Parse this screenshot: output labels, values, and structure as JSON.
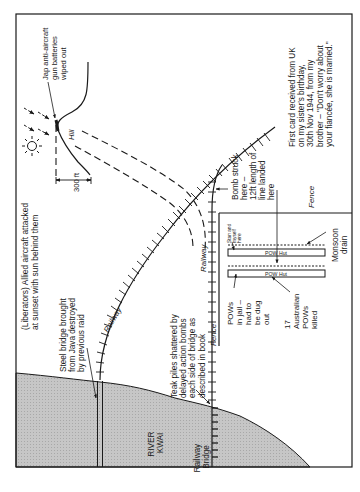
{
  "diagram": {
    "colors": {
      "ink": "#1a1a1a",
      "river_fill": "#c8c8c8",
      "paper": "#ffffff"
    },
    "labels": {
      "liberators": [
        "(Liberators) Allied aircraft attacked",
        "at sunset with sun behind them"
      ],
      "jap_guns": [
        "Jap anti-aircraft",
        "gun batteries",
        "wiped out"
      ],
      "hill": "Hill",
      "height": "300 ft",
      "first_card": [
        "First card received from UK",
        "on my sister's birthday,",
        "30th Nov 1944, from my",
        "brother – \"Don't worry about",
        "your fiancée, she is married.\""
      ],
      "steel_bridge": [
        "Steel bridge brought",
        "from Java destroyed",
        "by previous raid"
      ],
      "railway_curve": "Railway",
      "railway_straight": "Railway",
      "bomb_struck": [
        "Bomb struck",
        "here –",
        "12ft length of",
        "line landed",
        "here"
      ],
      "fence_top": "Fence",
      "fence_side": "Fence",
      "stan": [
        "Stan and",
        "myself",
        "here"
      ],
      "monsoon_drain": [
        "Monsoon",
        "drain"
      ],
      "pow_hut_1": "POW Hut",
      "pow_hut_2": "POW Hut",
      "pows_jail": [
        "POWs",
        "in jail –",
        "had to",
        "be dug",
        "out"
      ],
      "australian": [
        "17",
        "Australian",
        "POWs",
        "killed"
      ],
      "teak_piles": [
        "Teak piles shattered by",
        "delayed action bombs",
        "each side of bridge as",
        "described in book"
      ],
      "river": [
        "RIVER",
        "KWAI"
      ],
      "railway_bridge": [
        "Railway",
        "Bridge"
      ]
    }
  }
}
